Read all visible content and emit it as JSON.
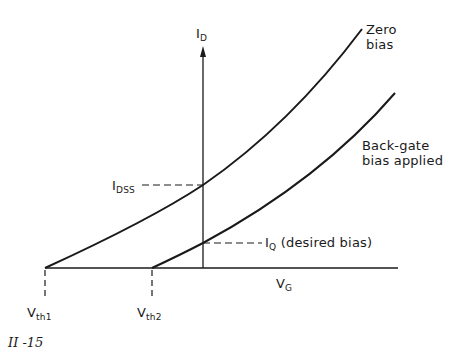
{
  "figure": {
    "number_label": "II -15",
    "y_axis": {
      "symbol": "I",
      "subscript": "D"
    },
    "x_axis": {
      "symbol": "V",
      "subscript": "G"
    },
    "curves": [
      {
        "name": "zero-bias",
        "label_line1": "Zero",
        "label_line2": "bias",
        "threshold": "Vth1"
      },
      {
        "name": "back-gate-bias",
        "label_line1": "Back-gate",
        "label_line2": "bias applied",
        "threshold": "Vth2"
      }
    ],
    "annotations": {
      "idss": {
        "symbol": "I",
        "subscript": "DSS"
      },
      "iq": {
        "symbol": "I",
        "subscript": "Q",
        "text": " (desired bias)"
      },
      "vth1": {
        "symbol": "V",
        "subscript": "th1"
      },
      "vth2": {
        "symbol": "V",
        "subscript": "th2"
      }
    },
    "colors": {
      "line": "#1a1a1a",
      "background": "#ffffff"
    }
  }
}
